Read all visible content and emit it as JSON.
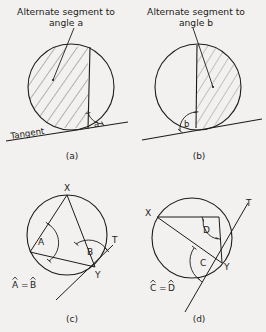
{
  "figure": {
    "background_color": "#f2f1ef",
    "ink_color": "#1d1c1a",
    "hatch_color": "#555350"
  },
  "panels": [
    {
      "id": "a",
      "caption": "(a)",
      "annotation": "Alternate segment to angle a",
      "annotation_line1": "Alternate segment to",
      "annotation_line2": "angle a",
      "angle_label": "a",
      "tangent_label": "Tangent",
      "shaded_side": "left",
      "description": "Circle with a tangent line at the bottom; a chord from the tangent point rises to the circle; the alternate segment on the left of the chord is hatched; angle a is marked between the chord and the tangent."
    },
    {
      "id": "b",
      "caption": "(b)",
      "annotation": "Alternate segment to angle b",
      "annotation_line1": "Alternate segment to",
      "annotation_line2": "angle b",
      "angle_label": "b",
      "tangent_label": "",
      "shaded_side": "right",
      "description": "Circle with a tangent line at the bottom; a chord from the tangent point rises to the circle; the alternate segment on the right of the chord is hatched; angle b is marked on the left of the chord at the tangent point."
    },
    {
      "id": "c",
      "caption": "(c)",
      "equation": "Â = B̂",
      "equation_left": "A",
      "equation_right": "B",
      "equation_operator": "=",
      "vertex_labels": [
        "X",
        "Y",
        "T"
      ],
      "angle_labels": [
        "A",
        "B"
      ],
      "description": "Circle with chord XY; X on top of the circle, Y at lower right where a tangent line TY touches. Angle A is the inscribed angle at a point on the major arc subtending XY; angle B is between chord XY and tangent ray YT. Angle A equals angle B."
    },
    {
      "id": "d",
      "caption": "(d)",
      "equation": "Ĉ = D̂",
      "equation_left": "C",
      "equation_right": "D",
      "equation_operator": "=",
      "vertex_labels": [
        "X",
        "Y",
        "T"
      ],
      "angle_labels": [
        "C",
        "D"
      ],
      "description": "Circle with chord XY; X at upper left, Y at right where a tangent line touches, with ray T going up-right. Angle D is the inscribed angle in the alternate segment; angle C is between chord XY and the tangent on the other side. Angle C equals angle D."
    }
  ]
}
